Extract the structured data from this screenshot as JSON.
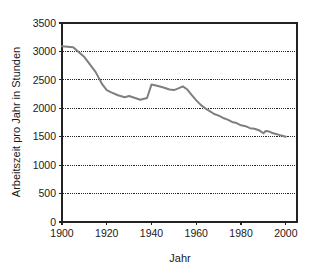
{
  "chart_data": {
    "type": "line",
    "title": "",
    "xlabel": "Jahr",
    "ylabel": "Arbeitszeit pro Jahr in Stunden",
    "xlim": [
      1900,
      2005
    ],
    "ylim": [
      0,
      3500
    ],
    "grid": true,
    "legend": false,
    "line_color": "#7f7f7f",
    "axis_color": "#222222",
    "background_color": "#ffffff",
    "x_ticks": [
      1900,
      1920,
      1940,
      1960,
      1980,
      2000
    ],
    "x_tick_labels": [
      "1900",
      "1920",
      "1940",
      "1960",
      "1980",
      "2000"
    ],
    "y_ticks": [
      0,
      500,
      1000,
      1500,
      2000,
      2500,
      3000,
      3500
    ],
    "y_tick_labels": [
      "0",
      "500",
      "1000",
      "1500",
      "2000",
      "2500",
      "3000",
      "3500"
    ],
    "series": [
      {
        "name": "Arbeitszeit pro Jahr in Stunden",
        "x": [
          1900,
          1905,
          1910,
          1915,
          1918,
          1920,
          1922,
          1925,
          1928,
          1930,
          1932,
          1935,
          1938,
          1939,
          1940,
          1942,
          1945,
          1948,
          1950,
          1952,
          1954,
          1956,
          1958,
          1960,
          1962,
          1964,
          1966,
          1968,
          1970,
          1972,
          1974,
          1976,
          1978,
          1980,
          1982,
          1984,
          1986,
          1988,
          1990,
          1991,
          1992,
          1993,
          1994,
          1996,
          1998,
          2000
        ],
        "values": [
          3090,
          3075,
          2900,
          2640,
          2420,
          2320,
          2280,
          2230,
          2195,
          2215,
          2190,
          2150,
          2180,
          2300,
          2420,
          2400,
          2370,
          2330,
          2320,
          2350,
          2385,
          2330,
          2230,
          2140,
          2060,
          2000,
          1950,
          1900,
          1870,
          1830,
          1800,
          1760,
          1740,
          1700,
          1685,
          1650,
          1640,
          1615,
          1560,
          1600,
          1595,
          1585,
          1565,
          1545,
          1520,
          1500
        ]
      }
    ]
  },
  "figure": {
    "y_axis_title": "Arbeitszeit pro Jahr in Stunden",
    "x_axis_title": "Jahr"
  }
}
